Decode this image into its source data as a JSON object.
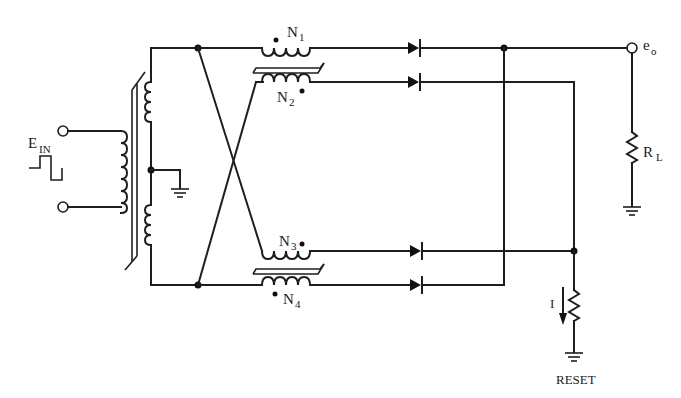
{
  "diagram": {
    "type": "circuit-schematic",
    "labels": {
      "input": {
        "main": "E",
        "sub": "IN"
      },
      "n1": {
        "main": "N",
        "sub": "1"
      },
      "n2": {
        "main": "N",
        "sub": "2"
      },
      "n3": {
        "main": "N",
        "sub": "3"
      },
      "n4": {
        "main": "N",
        "sub": "4"
      },
      "output": {
        "main": "e",
        "sub": "o"
      },
      "load": {
        "main": "R",
        "sub": "L"
      },
      "current": "I",
      "reset": "RESET"
    },
    "colors": {
      "line": "#1e1e1e",
      "background": "#ffffff"
    },
    "components": [
      {
        "id": "input-transformer",
        "kind": "center-tapped transformer"
      },
      {
        "id": "core-1",
        "kind": "saturable core",
        "windings": [
          "N1",
          "N2"
        ]
      },
      {
        "id": "core-2",
        "kind": "saturable core",
        "windings": [
          "N3",
          "N4"
        ]
      },
      {
        "id": "d1",
        "kind": "diode"
      },
      {
        "id": "d2",
        "kind": "diode"
      },
      {
        "id": "d3",
        "kind": "diode"
      },
      {
        "id": "d4",
        "kind": "diode"
      },
      {
        "id": "rl",
        "kind": "resistor",
        "label": "RL"
      },
      {
        "id": "r-reset",
        "kind": "resistor",
        "label": "RESET"
      }
    ]
  }
}
